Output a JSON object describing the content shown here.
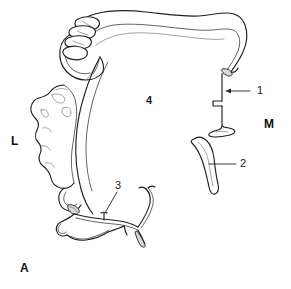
{
  "figure": {
    "panel_label": "A",
    "type": "anatomical line drawing",
    "background_color": "#ffffff",
    "line_color": "#231f20",
    "secondary_line_color": "#6f6f73",
    "shade_color": "#d9d9dc"
  },
  "callouts": [
    {
      "id": "callout-1",
      "label": "1",
      "label_x": 257,
      "label_y": 87,
      "leader_from_x": 250,
      "leader_from_y": 91,
      "leader_to_x": 224,
      "leader_to_y": 91,
      "target": "thin vertical plate with flared base (pterygoid hamulus)"
    },
    {
      "id": "callout-2",
      "label": "2",
      "label_x": 240,
      "label_y": 160,
      "leader_from_x": 236,
      "leader_from_y": 164,
      "leader_to_x": 209,
      "leader_to_y": 164,
      "target": "curved hook-shaped elongated bone fragment"
    },
    {
      "id": "callout-3",
      "label": "3",
      "label_x": 115,
      "label_y": 183,
      "leader_from_x": 117,
      "leader_from_y": 192,
      "leader_to_x": 104,
      "leader_to_y": 213,
      "target": "branching filamentous process at inferior margin"
    },
    {
      "id": "callout-4",
      "label": "4",
      "label_x": 146,
      "label_y": 97,
      "leader_from_x": null,
      "leader_from_y": null,
      "leader_to_x": null,
      "leader_to_y": null,
      "target": "open palatal / body region (no leader line)"
    }
  ],
  "orientation_markers": [
    {
      "id": "orientation-lateral",
      "label": "L",
      "x": 11,
      "y": 139,
      "meaning": "lateral"
    },
    {
      "id": "orientation-medial",
      "label": "M",
      "x": 264,
      "y": 122,
      "meaning": "medial"
    }
  ],
  "panel": {
    "label": "A",
    "x": 20,
    "y": 264
  }
}
